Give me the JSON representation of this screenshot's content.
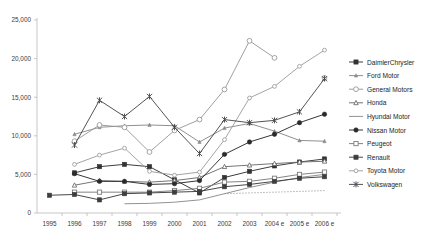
{
  "chart_data": {
    "type": "line",
    "title": "",
    "xlabel": "",
    "ylabel": "",
    "x": [
      "1995",
      "1996",
      "1997",
      "1998",
      "1999",
      "2000",
      "2001",
      "2002",
      "2003",
      "2004 e",
      "2005 e",
      "2006 e"
    ],
    "tick_labels": [
      "1995",
      "1996",
      "1997",
      "1998",
      "1999",
      "2000",
      "2001",
      "2002",
      "2003",
      "2004 e",
      "2005 e",
      "2006 e"
    ],
    "ylim": [
      0,
      25000
    ],
    "yticks": [
      0,
      5000,
      10000,
      15000,
      20000,
      25000
    ],
    "ytick_labels": [
      "0",
      "5,000",
      "10,000",
      "15,000",
      "20,000",
      "25,000"
    ],
    "grid": false,
    "legend_position": "right",
    "series": [
      {
        "name": "DaimlerChrysler",
        "marker": "square-filled",
        "color": "#333333",
        "dash": "none",
        "values": [
          null,
          5200,
          6000,
          6300,
          6000,
          4300,
          2600,
          4600,
          5400,
          6100,
          6600,
          7000
        ]
      },
      {
        "name": "Ford Motor",
        "marker": "triangle-small",
        "color": "#8a8a8a",
        "dash": "none",
        "values": [
          null,
          10200,
          11100,
          11300,
          11400,
          11300,
          9200,
          11000,
          11600,
          10600,
          9400,
          9300
        ]
      },
      {
        "name": "General Motors",
        "marker": "circle-open",
        "color": "#9a9a9a",
        "dash": "none",
        "values": [
          null,
          9300,
          11400,
          11100,
          7900,
          10700,
          12100,
          16000,
          22300,
          20100,
          null,
          17500
        ]
      },
      {
        "name": "Honda",
        "marker": "triangle-open",
        "color": "#6e6e6e",
        "dash": "none",
        "values": [
          null,
          3600,
          4200,
          4100,
          4000,
          4200,
          4600,
          6000,
          6200,
          6400,
          6600,
          6700
        ]
      },
      {
        "name": "Hyundai Motor",
        "marker": "none",
        "color": "#8c8c8c",
        "dash": "none",
        "values": [
          null,
          null,
          null,
          1200,
          1250,
          1400,
          1700,
          2500,
          3300,
          4000,
          4600,
          5000
        ]
      },
      {
        "name": "Nissan Motor",
        "marker": "circle-filled",
        "color": "#2b2b2b",
        "dash": "none",
        "values": [
          null,
          5100,
          4100,
          4100,
          3700,
          3800,
          4200,
          7600,
          9200,
          10200,
          11700,
          12800
        ]
      },
      {
        "name": "Peugeot",
        "marker": "square-open",
        "color": "#7d7d7d",
        "dash": "none",
        "values": [
          null,
          2700,
          2700,
          2700,
          2700,
          2900,
          3200,
          4000,
          4100,
          4500,
          5000,
          5300
        ]
      },
      {
        "name": "Renault",
        "marker": "square-filled",
        "color": "#3d3d3d",
        "dash": "none",
        "values": [
          2300,
          2400,
          1700,
          2500,
          2600,
          2700,
          2800,
          3400,
          3700,
          4100,
          4500,
          4700
        ]
      },
      {
        "name": "Toyota Motor",
        "marker": "circle-open-small",
        "color": "#9e9e9e",
        "dash": "none",
        "values": [
          null,
          6300,
          7500,
          8400,
          5400,
          4900,
          5300,
          9500,
          14900,
          16400,
          19000,
          21100
        ]
      },
      {
        "name": "Volkswagen",
        "marker": "star-x",
        "color": "#4a4a4a",
        "dash": "none",
        "values": [
          null,
          8800,
          14600,
          12500,
          15100,
          11100,
          7700,
          12100,
          11700,
          12000,
          13100,
          17400
        ]
      }
    ],
    "dotted_series": {
      "name": "",
      "values": [
        null,
        null,
        null,
        null,
        null,
        null,
        null,
        2500,
        2600,
        2700,
        2800,
        2900
      ],
      "dash": "1,2",
      "color": "#808080"
    }
  },
  "legend": {
    "items": [
      {
        "label": "DaimlerChrysler"
      },
      {
        "label": "Ford Motor"
      },
      {
        "label": "General Motors"
      },
      {
        "label": "Honda"
      },
      {
        "label": "Hyundai Motor"
      },
      {
        "label": "Nissan Motor"
      },
      {
        "label": "Peugeot"
      },
      {
        "label": "Renault"
      },
      {
        "label": "Toyota Motor"
      },
      {
        "label": "Volkswagen"
      }
    ]
  }
}
